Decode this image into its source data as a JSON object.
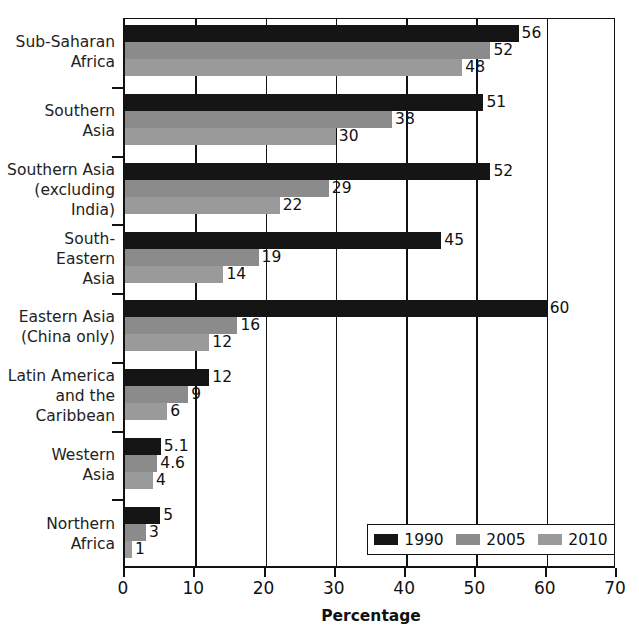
{
  "chart_data": {
    "type": "bar",
    "orientation": "horizontal",
    "title": "",
    "xlabel": "Percentage",
    "ylabel": "",
    "xlim": [
      0,
      70
    ],
    "xticks": [
      0,
      10,
      20,
      30,
      40,
      50,
      60,
      70
    ],
    "grid": true,
    "legend_position": "bottom-right",
    "categories": [
      "Sub-Saharan\nAfrica",
      "Southern\nAsia",
      "Southern Asia\n(excluding\nIndia)",
      "South-\nEastern\nAsia",
      "Eastern Asia\n(China only)",
      "Latin America\nand the\nCaribbean",
      "Western\nAsia",
      "Northern\nAfrica"
    ],
    "series": [
      {
        "name": "1990",
        "color": "#151515",
        "values": [
          56,
          51,
          52,
          45,
          60,
          12,
          5.1,
          5
        ],
        "labels": [
          "56",
          "51",
          "52",
          "45",
          "60",
          "12",
          "5.1",
          "5"
        ]
      },
      {
        "name": "2005",
        "color": "#8b8b8b",
        "values": [
          52,
          38,
          29,
          19,
          16,
          9,
          4.6,
          3
        ],
        "labels": [
          "52",
          "38",
          "29",
          "19",
          "16",
          "9",
          "4.6",
          "3"
        ]
      },
      {
        "name": "2010",
        "color": "#9a9a9a",
        "values": [
          48,
          30,
          22,
          14,
          12,
          6,
          4,
          1
        ],
        "labels": [
          "48",
          "30",
          "22",
          "14",
          "12",
          "6",
          "4",
          "1"
        ]
      }
    ]
  },
  "axis": {
    "x_title": "Percentage",
    "x_tick_labels": [
      "0",
      "10",
      "20",
      "30",
      "40",
      "50",
      "60",
      "70"
    ],
    "y_tick_labels": [
      "Sub-Saharan\nAfrica",
      "Southern\nAsia",
      "Southern Asia\n(excluding\nIndia)",
      "South-\nEastern\nAsia",
      "Eastern Asia\n(China only)",
      "Latin America\nand the\nCaribbean",
      "Western\nAsia",
      "Northern\nAfrica"
    ]
  },
  "legend": {
    "items": [
      {
        "label": "1990",
        "color": "#151515"
      },
      {
        "label": "2005",
        "color": "#8b8b8b"
      },
      {
        "label": "2010",
        "color": "#9a9a9a"
      }
    ]
  },
  "bar_labels": {
    "sub_saharan_africa": [
      "56",
      "52",
      "48"
    ],
    "southern_asia": [
      "51",
      "38",
      "30"
    ],
    "southern_asia_excl_india": [
      "52",
      "29",
      "22"
    ],
    "south_eastern_asia": [
      "45",
      "19",
      "14"
    ],
    "eastern_asia_china_only": [
      "60",
      "16",
      "12"
    ],
    "latin_america_and_caribbean": [
      "12",
      "9",
      "6"
    ],
    "western_asia": [
      "5.1",
      "4.6",
      "4"
    ],
    "northern_africa": [
      "5",
      "3",
      "1"
    ]
  }
}
